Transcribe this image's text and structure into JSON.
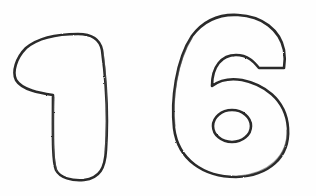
{
  "image": {
    "description": "Hand-drawn pencil outline sketch of the number 16",
    "text": "16",
    "digits": [
      {
        "char": "1",
        "style": "outlined bubble digit"
      },
      {
        "char": "6",
        "style": "outlined bubble digit"
      }
    ],
    "colors": {
      "background": "#fefefe",
      "stroke": "#2b2b2b"
    }
  }
}
